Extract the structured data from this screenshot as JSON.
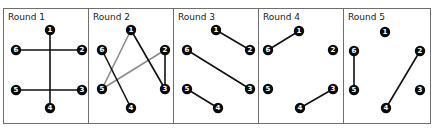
{
  "colors": {
    "edge_primary": "#111111",
    "edge_secondary": "#8c8c8c",
    "node": "#0a0a0a",
    "frame": "#6e6e6e"
  },
  "layout": {
    "frame_top": 8,
    "frame_bottom": 123,
    "panel_width": 85,
    "panel_starts": [
      3,
      88,
      173,
      258,
      343
    ],
    "last_panel_right": 430
  },
  "rounds": [
    {
      "title": "Round 1",
      "nodes": [
        {
          "id": "1",
          "x": 47,
          "y": 22
        },
        {
          "id": "2",
          "x": 79,
          "y": 42
        },
        {
          "id": "3",
          "x": 79,
          "y": 82
        },
        {
          "id": "4",
          "x": 47,
          "y": 100
        },
        {
          "id": "5",
          "x": 13,
          "y": 82
        },
        {
          "id": "6",
          "x": 13,
          "y": 42
        }
      ],
      "edges": [
        {
          "from": "1",
          "to": "4",
          "style": "primary"
        },
        {
          "from": "6",
          "to": "2",
          "style": "primary"
        },
        {
          "from": "5",
          "to": "3",
          "style": "primary"
        }
      ]
    },
    {
      "title": "Round 2",
      "nodes": [
        {
          "id": "1",
          "x": 43,
          "y": 22
        },
        {
          "id": "2",
          "x": 77,
          "y": 42
        },
        {
          "id": "3",
          "x": 77,
          "y": 81
        },
        {
          "id": "4",
          "x": 43,
          "y": 100
        },
        {
          "id": "5",
          "x": 14,
          "y": 81
        },
        {
          "id": "6",
          "x": 14,
          "y": 42
        }
      ],
      "edges": [
        {
          "from": "1",
          "to": "5",
          "style": "secondary"
        },
        {
          "from": "2",
          "to": "5",
          "style": "secondary"
        },
        {
          "from": "1",
          "to": "3",
          "style": "primary"
        },
        {
          "from": "2",
          "to": "3",
          "style": "primary"
        },
        {
          "from": "6",
          "to": "4",
          "style": "primary"
        }
      ]
    },
    {
      "title": "Round 3",
      "nodes": [
        {
          "id": "1",
          "x": 43,
          "y": 22
        },
        {
          "id": "2",
          "x": 77,
          "y": 42
        },
        {
          "id": "3",
          "x": 77,
          "y": 81
        },
        {
          "id": "4",
          "x": 45,
          "y": 100
        },
        {
          "id": "5",
          "x": 14,
          "y": 81
        },
        {
          "id": "6",
          "x": 14,
          "y": 42
        }
      ],
      "edges": [
        {
          "from": "1",
          "to": "2",
          "style": "primary"
        },
        {
          "from": "6",
          "to": "3",
          "style": "primary"
        },
        {
          "from": "5",
          "to": "4",
          "style": "primary"
        }
      ]
    },
    {
      "title": "Round 4",
      "nodes": [
        {
          "id": "1",
          "x": 41,
          "y": 23
        },
        {
          "id": "2",
          "x": 75,
          "y": 42
        },
        {
          "id": "3",
          "x": 75,
          "y": 81
        },
        {
          "id": "4",
          "x": 42,
          "y": 100
        },
        {
          "id": "5",
          "x": 10,
          "y": 81
        },
        {
          "id": "6",
          "x": 10,
          "y": 42
        }
      ],
      "edges": [
        {
          "from": "1",
          "to": "6",
          "style": "primary"
        },
        {
          "from": "3",
          "to": "4",
          "style": "primary"
        }
      ]
    },
    {
      "title": "Round 5",
      "nodes": [
        {
          "id": "1",
          "x": 42,
          "y": 24
        },
        {
          "id": "2",
          "x": 77,
          "y": 43
        },
        {
          "id": "3",
          "x": 77,
          "y": 82
        },
        {
          "id": "4",
          "x": 43,
          "y": 100
        },
        {
          "id": "5",
          "x": 11,
          "y": 82
        },
        {
          "id": "6",
          "x": 11,
          "y": 43
        }
      ],
      "edges": [
        {
          "from": "6",
          "to": "5",
          "style": "primary"
        },
        {
          "from": "2",
          "to": "4",
          "style": "primary"
        }
      ]
    }
  ]
}
